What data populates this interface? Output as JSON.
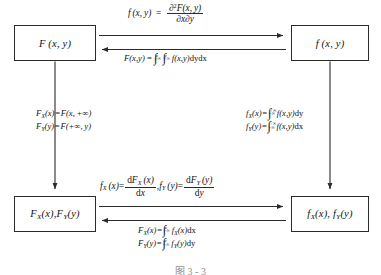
{
  "figure": {
    "caption": "图 3 - 3",
    "stroke_color": "#2b2b2b",
    "text_color": "#121212",
    "background": "#ffffff"
  },
  "nodes": {
    "top_left": {
      "label": "F (x, y)",
      "name": "joint-cdf"
    },
    "top_right": {
      "label": "f (x, y)",
      "name": "joint-pdf"
    },
    "bottom_left": {
      "label": "FX(x), FY(y)",
      "name": "marginal-cdfs"
    },
    "bottom_right": {
      "label": "fX(x), fY(y)",
      "name": "marginal-pdfs"
    }
  },
  "edges": {
    "top_forward": {
      "from": "F(x,y)",
      "to": "f(x,y)",
      "formula_text": "f(x, y) = ∂²F(x, y) / ∂x∂y",
      "lhs": "f (x, y)",
      "equals": "=",
      "numerator": "∂²F(x, y)",
      "denominator": "∂x∂y"
    },
    "top_backward": {
      "from": "f(x,y)",
      "to": "F(x,y)",
      "formula_text": "F(x,y) = ∫₋∞ˣ ∫₋∞ʸ f(x,y)dydx",
      "lhs": "F(x,y)",
      "equals": "=",
      "int1_upper": "x",
      "int1_lower": "−∞",
      "int2_upper": "y",
      "int2_lower": "−∞",
      "integrand": "f(x,y)",
      "differentials": "dydx"
    },
    "left_down": {
      "from": "F(x,y)",
      "to": "FX(x), FY(y)",
      "line1": "FX(x) = F(x, +∞)",
      "line2": "FY(y) = F(+∞, y)",
      "line1_parts": {
        "lhs": "F",
        "sub": "X",
        "arg": "(x)",
        "equals": "=",
        "rhs": "F(x, +∞)"
      },
      "line2_parts": {
        "lhs": "F",
        "sub": "Y",
        "arg": "(y)",
        "equals": "=",
        "rhs": "F(+∞, y)"
      }
    },
    "right_down": {
      "from": "f(x,y)",
      "to": "fX(x), fY(y)",
      "line1": "fX(x) = ∫₋∞^{+∞} f(x,y)dy",
      "line2": "fY(y) = ∫₋∞^{+∞} f(x,y)dx",
      "line1_parts": {
        "lhs": "f",
        "sub": "X",
        "arg": "(x)",
        "equals": "=",
        "upper": "+∞",
        "lower": "−∞",
        "integrand": "f(x,y)",
        "diff": "dy"
      },
      "line2_parts": {
        "lhs": "f",
        "sub": "Y",
        "arg": "(y)",
        "equals": "=",
        "upper": "+∞",
        "lower": "−∞",
        "integrand": "f(x,y)",
        "diff": "dx"
      }
    },
    "bottom_forward": {
      "from": "FX(x), FY(y)",
      "to": "fX(x), fY(y)",
      "formula_text": "fX(x) = dFX(x)/dx , fY(y) = dFY(y)/dy",
      "p1_lhs": "f",
      "p1_sub": "X",
      "p1_arg": "(x)",
      "p1_equals": "=",
      "p1_num_d": "d",
      "p1_num_F": "F",
      "p1_num_sub": "X",
      "p1_num_arg": "(x)",
      "p1_den": "dx",
      "comma": ",",
      "p2_lhs": "f",
      "p2_sub": "Y",
      "p2_arg": "(y)",
      "p2_equals": "=",
      "p2_num_d": "d",
      "p2_num_F": "F",
      "p2_num_sub": "Y",
      "p2_num_arg": "(y)",
      "p2_den": "dy"
    },
    "bottom_backward": {
      "from": "fX(x), fY(y)",
      "to": "FX(x), FY(y)",
      "line1": "FX(x) = ∫₋∞ˣ fX(x)dx",
      "line2": "FY(y) = ∫₋∞ʸ fY(y)dy",
      "line1_parts": {
        "lhs": "F",
        "sub": "X",
        "arg": "(x)",
        "equals": "=",
        "upper": "x",
        "lower": "−∞",
        "int_f": "f",
        "int_sub": "X",
        "int_arg": "(x)",
        "diff": "dx"
      },
      "line2_parts": {
        "lhs": "F",
        "sub": "Y",
        "arg": "(y)",
        "equals": "=",
        "upper": "y",
        "lower": "−∞",
        "int_f": "f",
        "int_sub": "Y",
        "int_arg": "(y)",
        "diff": "dy"
      }
    }
  },
  "symbols": {
    "integral": "∫",
    "partial": "∂",
    "infinity": "∞"
  }
}
